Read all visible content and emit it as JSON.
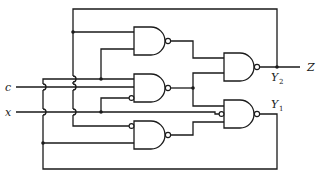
{
  "diagram": {
    "type": "logic-circuit",
    "inputs": [
      {
        "id": "c",
        "label": "c"
      },
      {
        "id": "x",
        "label": "x"
      }
    ],
    "outputs": [
      {
        "id": "Z",
        "label": "Z"
      }
    ],
    "state_variables": [
      {
        "id": "Y2",
        "label": "Y",
        "subscript": "2"
      },
      {
        "id": "Y1",
        "label": "Y",
        "subscript": "1"
      }
    ],
    "gates": [
      {
        "id": "G1",
        "type": "NAND",
        "inputs": [
          "y2",
          "y1"
        ]
      },
      {
        "id": "G2",
        "type": "NAND",
        "inputs": [
          "y1",
          "c",
          "x'"
        ]
      },
      {
        "id": "G3",
        "type": "NAND",
        "inputs": [
          "y2'",
          "y1"
        ]
      },
      {
        "id": "G4",
        "type": "NAND",
        "inputs": [
          "G1",
          "G2"
        ],
        "output": "Y2"
      },
      {
        "id": "G5",
        "type": "NAND",
        "inputs": [
          "G2",
          "x'",
          "G3"
        ],
        "output": "Y1"
      }
    ],
    "colors": {
      "ink": "#1a1a1a",
      "background": "#ffffff"
    }
  }
}
